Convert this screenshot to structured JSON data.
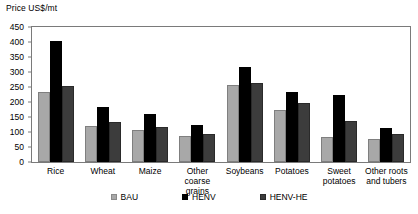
{
  "chart_data": {
    "type": "bar",
    "title": "",
    "ylabel": "Price US$/mt",
    "xlabel": "",
    "ylim": [
      0,
      450
    ],
    "yticks": [
      0,
      50,
      100,
      150,
      200,
      250,
      300,
      350,
      400,
      450
    ],
    "grid": false,
    "legend_position": "bottom",
    "categories": [
      "Rice",
      "Wheat",
      "Maize",
      "Other coarse grains",
      "Soybeans",
      "Potatoes",
      "Sweet potatoes",
      "Other roots and tubers"
    ],
    "category_labels_wrapped": [
      [
        "Rice"
      ],
      [
        "Wheat"
      ],
      [
        "Maize"
      ],
      [
        "Other coarse",
        "grains"
      ],
      [
        "Soybeans"
      ],
      [
        "Potatoes"
      ],
      [
        "Sweet",
        "potatoes"
      ],
      [
        "Other roots",
        "and tubers"
      ]
    ],
    "series": [
      {
        "name": "BAU",
        "color": "#a8a8a8",
        "values": [
          232,
          120,
          108,
          88,
          258,
          175,
          82,
          78
        ]
      },
      {
        "name": "HENV",
        "color": "#000000",
        "values": [
          405,
          185,
          160,
          125,
          318,
          232,
          222,
          115
        ]
      },
      {
        "name": "HENV-HE",
        "color": "#3c3c3c",
        "values": [
          252,
          132,
          118,
          93,
          262,
          197,
          138,
          92
        ]
      }
    ]
  },
  "legend": {
    "items": [
      {
        "label": "BAU"
      },
      {
        "label": "HENV"
      },
      {
        "label": "HENV-HE"
      }
    ]
  }
}
